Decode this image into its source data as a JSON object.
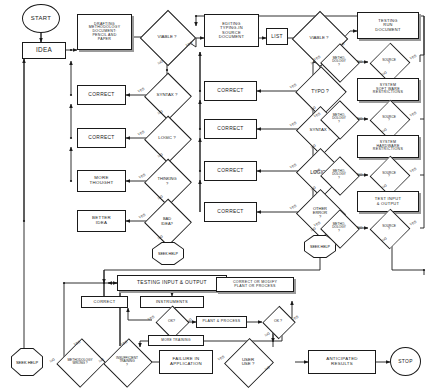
{
  "diagram": {
    "stroke_color": "#1a1a1a",
    "background": "#ffffff",
    "shadow_color": "#9a9a9a",
    "labels": {
      "yes": "YES",
      "no": "NO"
    }
  },
  "nodes": {
    "start": "START",
    "idea": "IDEA",
    "drafting": "DRAFTING\nMETHODOLOGY\nDOCUMENT:\nPENCIL AND\nPAPER",
    "viable1": "VIABLE ?",
    "correct_l1": "CORRECT",
    "syntax_l": "SYNTAX ?",
    "correct_l2": "CORRECT",
    "logic_l": "LOGIC ?",
    "more_thought": "MORE\nTHOUGHT",
    "thinking": "THINKING\n?",
    "better_idea": "BETTER\nIDEA",
    "bad_idea": "BAD\nIDEA?",
    "seek_help_left": "SEEK\nHELP",
    "editing": "EDITING\nTYPING-IN\nSOURCE\nDOCUMENT",
    "list": "LIST",
    "viable2": "VIABLE ?",
    "correct_m1": "CORRECT",
    "typo": "TYPO ?",
    "correct_m2": "CORRECT",
    "syntax_m": "SYNTAX ?",
    "correct_m3": "CORRECT",
    "logic_m": "LOGIC ?",
    "correct_m4": "CORRECT",
    "other_error": "OTHER\nERROR\n?",
    "seek_help_mid": "SEEK\nHELP",
    "testing_run": "TESTING\nRUN\nDOCUMENT",
    "methodology1": "METHO-\nDOLOGY\n?",
    "source1": "SOURCE\n?",
    "system_software": "SYSTEM\nSOFT WARE\nRESTRICTIONS",
    "methodology2": "METHO-\nDOLOGY\n?",
    "source2": "SOURCE\n?",
    "system_hardware": "SYSTEM\nHARDWARE\nRESTRICTIONS",
    "methodology3": "METHO-\nDOLOGY\n?",
    "source3": "SOURCE\n?",
    "test_io": "TEST INPUT\n& OUTPUT",
    "methodology4": "METHO-\nDOLOGY\n?",
    "source4": "SOURCE\n?",
    "testing_io": "TESTING INPUT & OUTPUT",
    "correct_b": "CORRECT",
    "instruments": "INSTRUMENTS",
    "ok1": "OK?",
    "plant_process": "PLANT & PROCESS",
    "ok2": "OK ?",
    "correct_modify": "CORRECT OR MODIFY\nPLANT OR PROCESS",
    "more_training": "MORE TRAINING",
    "seek_help_bottom": "SEEK\nHELP",
    "methodology_wrong": "METHODOLOGY\nWRONG ?",
    "insufficient_training": "INSUFFICIENT\nTRAINING\n?",
    "failure": "FAILURE IN\nAPPLICATION",
    "user_use": "USER\nUSE ?",
    "anticipated": "ANTICIPATED\nRESULTS",
    "stop": "STOP"
  },
  "edge_labels": {
    "viable1_yes": "YES",
    "viable1_no": "NO",
    "syntax_l_yes": "YES",
    "syntax_l_no": "NO",
    "logic_l_yes": "YES",
    "logic_l_no": "NO",
    "thinking_yes": "YES",
    "thinking_no": "NO",
    "bad_idea_yes": "YES",
    "bad_idea_no": "NO",
    "viable2_yes": "YES",
    "viable2_no": "NO",
    "typo_yes": "YES",
    "typo_no": "NO",
    "syntax_m_yes": "YES",
    "syntax_m_no": "NO",
    "logic_m_yes": "YES",
    "logic_m_no": "NO",
    "other_error_yes": "YES",
    "other_error_no": "NO",
    "meth1_yes": "YES",
    "meth1_no": "NO",
    "src1_yes": "YES",
    "src1_no": "NO",
    "meth2_yes": "YES",
    "meth2_no": "NO",
    "src2_yes": "YES",
    "src2_no": "NO",
    "meth3_yes": "YES",
    "meth3_no": "NO",
    "src3_yes": "YES",
    "src3_no": "NO",
    "meth4_yes": "YES",
    "meth4_no": "NO",
    "src4_yes": "YES",
    "src4_no": "NO",
    "ok1_yes": "YES",
    "ok1_no": "NO",
    "ok2_yes": "YES",
    "ok2_no": "NO",
    "meth_wrong_yes": "YES",
    "meth_wrong_no": "NO",
    "insuff_yes": "YES",
    "insuff_no": "NO",
    "user_use_yes": "YES",
    "user_use_no": "NO"
  }
}
